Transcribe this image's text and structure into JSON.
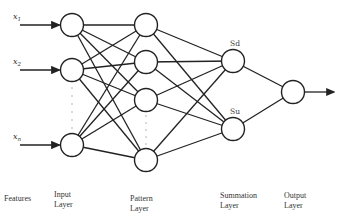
{
  "diagram": {
    "inputs": [
      {
        "id": "x1",
        "label": "x",
        "sub": "1"
      },
      {
        "id": "x2",
        "label": "x",
        "sub": "2"
      },
      {
        "id": "xn",
        "label": "x",
        "sub": "n"
      }
    ],
    "layers": {
      "input": {
        "nodes": 3,
        "ellipsis_after": 1
      },
      "pattern": {
        "nodes": 4,
        "ellipsis_after": 2
      },
      "summation": {
        "nodes": [
          "Sd",
          "Su"
        ]
      },
      "output": {
        "nodes": 1
      }
    },
    "summation_labels": [
      "Sd",
      "Su"
    ],
    "column_labels": [
      {
        "line1": "Features",
        "line2": ""
      },
      {
        "line1": "Input",
        "line2": "Layer"
      },
      {
        "line1": "Pattern",
        "line2": "Layer"
      },
      {
        "line1": "Summation",
        "line2": "Layer"
      },
      {
        "line1": "Output",
        "line2": "Layer"
      }
    ]
  }
}
